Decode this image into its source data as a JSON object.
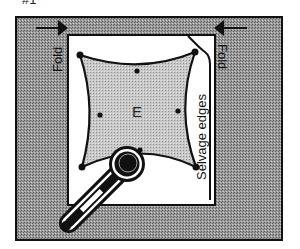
{
  "figure": {
    "label": "#1",
    "piece_label": "E",
    "labels": {
      "fold_left": "Fold",
      "fold_right": "Fold",
      "selvage": "Selvage edges"
    },
    "icons": [
      "fold-arrow-left-icon",
      "fold-arrow-right-icon",
      "rotary-cutter-icon",
      "pattern-notch-icon"
    ],
    "colors": {
      "background": "#ffffff",
      "fabric_fold": "#8c8c8c",
      "pattern_piece": "#bdbdbd",
      "outline": "#111111"
    }
  }
}
